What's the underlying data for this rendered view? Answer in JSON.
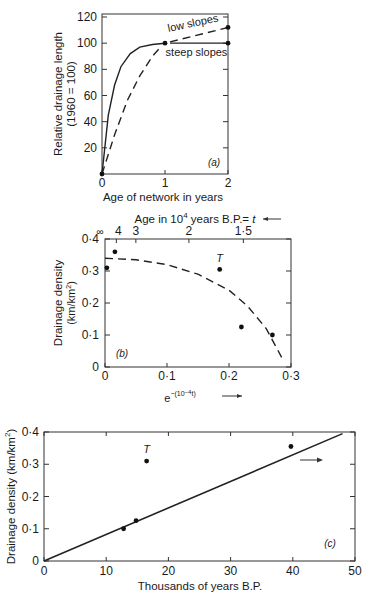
{
  "chart_data": [
    {
      "panel": "a",
      "type": "line",
      "title": "",
      "panel_label": "(a)",
      "xlabel": "Age of network in years",
      "ylabel": "Relative drainage length",
      "ylabel2": "(1960 = 100)",
      "xlim": [
        0,
        2
      ],
      "ylim": [
        0,
        120
      ],
      "xticks": [
        "0",
        "1",
        "2"
      ],
      "yticks": [
        "20",
        "40",
        "60",
        "80",
        "100",
        "120"
      ],
      "grid": false,
      "series": [
        {
          "name": "steep slopes",
          "style": "solid",
          "x": [
            0,
            0.1,
            0.2,
            0.3,
            0.45,
            0.6,
            0.8,
            1.0,
            2.0
          ],
          "y": [
            0,
            45,
            68,
            82,
            92,
            97,
            99,
            100,
            100
          ]
        },
        {
          "name": "low slopes",
          "style": "dashed",
          "x": [
            0,
            0.2,
            0.4,
            0.6,
            0.8,
            0.95,
            1.0,
            2.0
          ],
          "y": [
            0,
            30,
            56,
            75,
            90,
            98,
            100,
            112
          ]
        }
      ],
      "points": [
        {
          "x": 0,
          "y": 0
        },
        {
          "x": 1,
          "y": 100
        },
        {
          "x": 2,
          "y": 100
        },
        {
          "x": 2,
          "y": 112
        }
      ],
      "annotations": [
        "low slopes",
        "steep slopes"
      ]
    },
    {
      "panel": "b",
      "type": "scatter",
      "panel_label": "(b)",
      "xlabel": "e^-(10^-4 t)",
      "xlabel_arrow": "→",
      "top_axis_label": "Age in 10^4 years B.P. = t",
      "top_axis_arrow": "←",
      "top_ticks": [
        "∞",
        "4",
        "3",
        "2",
        "1·5"
      ],
      "ylabel": "Drainage density",
      "ylabel2": "(km/km²)",
      "xlim": [
        0,
        0.3
      ],
      "ylim": [
        0,
        0.4
      ],
      "xticks": [
        "0",
        "0·1",
        "0·2",
        "0·3"
      ],
      "yticks": [
        "0",
        "0·1",
        "0·2",
        "0·3",
        "0·4"
      ],
      "grid": false,
      "points": [
        {
          "x": 0.003,
          "y": 0.31,
          "label": ""
        },
        {
          "x": 0.016,
          "y": 0.36,
          "label": ""
        },
        {
          "x": 0.185,
          "y": 0.305,
          "label": "T"
        },
        {
          "x": 0.22,
          "y": 0.125,
          "label": ""
        },
        {
          "x": 0.27,
          "y": 0.1,
          "label": ""
        }
      ],
      "fit_curve": {
        "style": "dashed",
        "x": [
          0,
          0.05,
          0.1,
          0.15,
          0.2,
          0.23,
          0.26,
          0.285
        ],
        "y": [
          0.34,
          0.335,
          0.32,
          0.29,
          0.24,
          0.19,
          0.12,
          0.03
        ]
      }
    },
    {
      "panel": "c",
      "type": "scatter",
      "panel_label": "(c)",
      "xlabel": "Thousands of years B.P.",
      "ylabel": "Drainage density (km/km²)",
      "xlim": [
        0,
        50
      ],
      "ylim": [
        0,
        0.4
      ],
      "xticks": [
        "0",
        "10",
        "20",
        "30",
        "40",
        "50"
      ],
      "yticks": [
        "0",
        "0·1",
        "0·2",
        "0·3",
        "0·4"
      ],
      "grid": false,
      "points": [
        {
          "x": 12.8,
          "y": 0.1,
          "label": ""
        },
        {
          "x": 14.8,
          "y": 0.125,
          "label": ""
        },
        {
          "x": 16.5,
          "y": 0.31,
          "label": "T"
        },
        {
          "x": 39.7,
          "y": 0.355,
          "label": ""
        }
      ],
      "fit_line": {
        "style": "solid",
        "x": [
          0,
          48
        ],
        "y": [
          0,
          0.395
        ]
      },
      "annotations": [
        "→"
      ]
    }
  ]
}
